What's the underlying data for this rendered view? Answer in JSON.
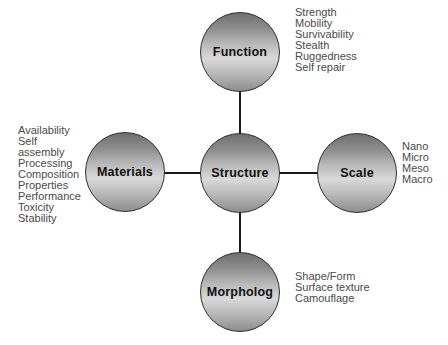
{
  "style": {
    "background": "#ffffff",
    "node_border": "#2e2e2e",
    "node_gradient_top": "#6f6f6f",
    "node_gradient_mid": "#d9d9d9",
    "node_gradient_bottom": "#8e8e8e",
    "connector_color": "#1a1a1a",
    "label_color": "#111111",
    "list_color": "#4a4a4a"
  },
  "nodes": {
    "center": {
      "label": "Structure"
    },
    "top": {
      "label": "Function",
      "items": [
        "Strength",
        "Mobility",
        "Survivability",
        "Stealth",
        "Ruggedness",
        "Self repair"
      ]
    },
    "left": {
      "label": "Materials",
      "items": [
        "Availability",
        "Self",
        "assembly",
        "Processing",
        "Composition",
        "Properties",
        "Performance",
        "Toxicity",
        "Stability"
      ]
    },
    "right": {
      "label": "Scale",
      "items": [
        "Nano",
        "Micro",
        "Meso",
        "Macro"
      ]
    },
    "bottom": {
      "label": "Morpholog",
      "items": [
        "Shape/Form",
        "Surface texture",
        "Camouflage"
      ]
    }
  }
}
